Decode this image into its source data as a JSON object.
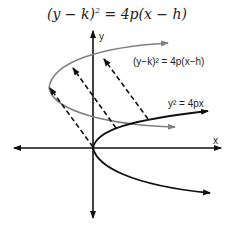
{
  "title": {
    "pre": "(y − k)",
    "exp": "2",
    "post": " = 4p(x − h)"
  },
  "labels": {
    "y_axis": "y",
    "x_axis": "x",
    "translated_parabola": "(y−k)² = 4p(x−h)",
    "base_parabola": "y² = 4px"
  },
  "colors": {
    "axis": "#111111",
    "base_parabola": "#111111",
    "translated_parabola": "#808080",
    "dashed": "#111111"
  }
}
